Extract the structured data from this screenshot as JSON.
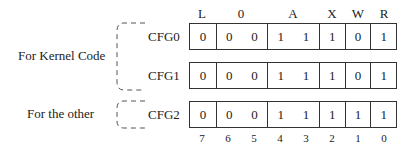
{
  "diagram": {
    "field_headers": [
      {
        "label": "L",
        "bits": [
          7
        ]
      },
      {
        "label": "0",
        "bits": [
          6,
          5
        ]
      },
      {
        "label": "A",
        "bits": [
          4,
          3
        ]
      },
      {
        "label": "X",
        "bits": [
          2
        ]
      },
      {
        "label": "W",
        "bits": [
          1
        ]
      },
      {
        "label": "R",
        "bits": [
          0
        ]
      }
    ],
    "header_labels": [
      "L",
      "0",
      "A",
      "X",
      "W",
      "R"
    ],
    "bit_numbers": [
      "7",
      "6",
      "5",
      "4",
      "3",
      "2",
      "1",
      "0"
    ],
    "groups": [
      {
        "label": "For Kernel Code",
        "registers": [
          "CFG0",
          "CFG1"
        ]
      },
      {
        "label": "For the other",
        "registers": [
          "CFG2"
        ]
      }
    ],
    "registers": [
      {
        "name": "CFG0",
        "bits": [
          "0",
          "0",
          "0",
          "1",
          "1",
          "1",
          "0",
          "1"
        ]
      },
      {
        "name": "CFG1",
        "bits": [
          "0",
          "0",
          "0",
          "1",
          "1",
          "1",
          "0",
          "1"
        ]
      },
      {
        "name": "CFG2",
        "bits": [
          "0",
          "0",
          "0",
          "1",
          "1",
          "1",
          "1",
          "1"
        ]
      }
    ],
    "colors": {
      "line": "#333333",
      "text": "#222222",
      "background": "#ffffff"
    }
  }
}
